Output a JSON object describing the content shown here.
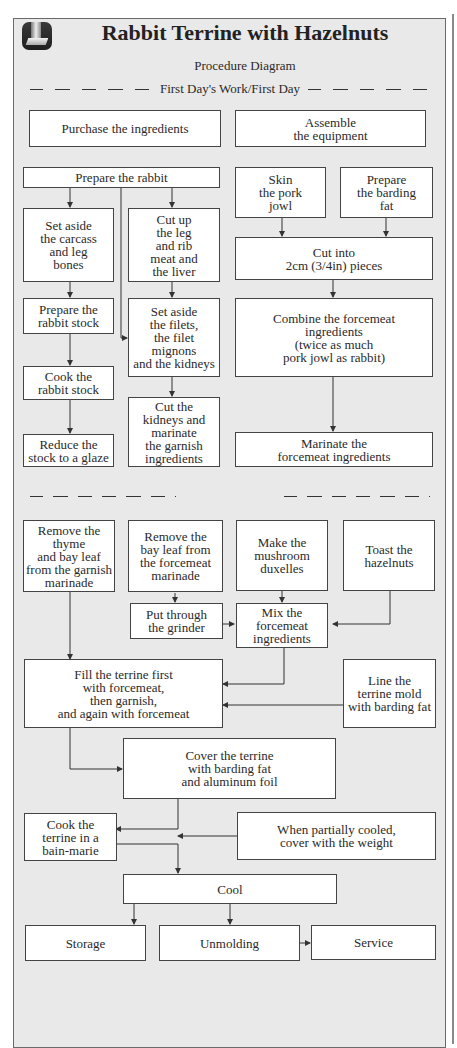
{
  "header": {
    "title": "Rabbit Terrine with Hazelnuts",
    "subtitle": "Procedure Diagram",
    "section_label": "First Day's Work/First Day",
    "logo_icon": "terrine-book-icon"
  },
  "steps": {
    "purchase": "Purchase the ingredients",
    "assemble": "Assemble\nthe equipment",
    "prepare_rabbit": "Prepare the rabbit",
    "skin_jowl": "Skin\nthe pork\njowl",
    "prepare_barding": "Prepare\nthe barding\nfat",
    "set_aside_carcass": "Set aside\nthe carcass\nand leg\nbones",
    "cut_up_leg": "Cut up\nthe leg\nand rib\nmeat and\nthe liver",
    "cut_into": "Cut into\n2cm (3/4in) pieces",
    "prepare_stock": "Prepare the\nrabbit stock",
    "set_aside_filets": "Set aside\nthe filets,\nthe filet mignons\nand the kidneys",
    "combine_forcemeat": "Combine the forcemeat\ningredients\n(twice as much\npork jowl as rabbit)",
    "cook_stock": "Cook the\nrabbit stock",
    "cut_kidneys": "Cut the\nkidneys and\nmarinate\nthe garnish\ningredients",
    "reduce_stock": "Reduce the\nstock to a glaze",
    "marinate_forcemeat": "Marinate the\nforcemeat ingredients",
    "remove_thyme": "Remove the thyme\nand bay leaf\nfrom the garnish\nmarinade",
    "remove_bay": "Remove the\nbay leaf from\nthe forcemeat\nmarinade",
    "make_duxelles": "Make the\nmushroom\nduxelles",
    "toast_hazelnuts": "Toast the\nhazelnuts",
    "grinder": "Put through\nthe grinder",
    "mix_forcemeat": "Mix the\nforcemeat\ningredients",
    "fill_terrine": "Fill the terrine first\nwith forcemeat,\nthen garnish,\nand again with forcemeat",
    "line_mold": "Line the\nterrine mold\nwith barding fat",
    "cover_terrine": "Cover the terrine\nwith barding fat\nand aluminum foil",
    "cook_bain_marie": "Cook the\nterrine in a\nbain-marie",
    "weight": "When partially cooled,\ncover with the weight",
    "cool": "Cool",
    "storage": "Storage",
    "unmolding": "Unmolding",
    "service": "Service"
  },
  "colors": {
    "panel_bg": "#e9e9e9",
    "box_bg": "#ffffff",
    "line": "#333333"
  }
}
